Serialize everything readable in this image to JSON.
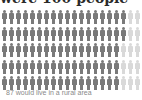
{
  "title": "were 100 people",
  "caption": "87 would live in a rural area",
  "colors": {
    "rural": "#7a7a7a",
    "other": "#d9d9d9"
  },
  "chart_data": {
    "type": "pictogram",
    "title": "were 100 people",
    "total": 100,
    "columns": 20,
    "rows": 5,
    "highlighted_count": 87,
    "highlighted_label": "would live in a rural area",
    "rows_highlighted": [
      18,
      18,
      17,
      17,
      17
    ],
    "annotations": [
      "87 would live in a rural area"
    ]
  }
}
